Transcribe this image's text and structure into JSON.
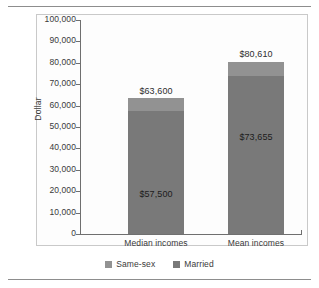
{
  "chart_data": {
    "type": "bar",
    "subtype": "stacked-bar",
    "title": "",
    "xlabel": "",
    "ylabel": "Dollar",
    "categories": [
      "Median incomes",
      "Mean incomes"
    ],
    "series": [
      {
        "name": "Married",
        "values": [
          57500,
          73655
        ],
        "color": "#797979"
      },
      {
        "name": "Same-sex",
        "values": [
          6100,
          6955
        ],
        "color": "#929292"
      }
    ],
    "totals": [
      63600,
      80610
    ],
    "bar_labels": {
      "totals": [
        "$63,600",
        "$80,610"
      ],
      "inner": [
        "$57,500",
        "$73,655"
      ]
    },
    "ylim": [
      0,
      100000
    ],
    "ytick_values": [
      0,
      10000,
      20000,
      30000,
      40000,
      50000,
      60000,
      70000,
      80000,
      90000,
      100000
    ],
    "ytick_labels": [
      "0",
      "10,000",
      "20,000",
      "30,000",
      "40,000",
      "50,000",
      "60,000",
      "70,000",
      "80,000",
      "90,000",
      "100,000"
    ],
    "grid": false,
    "legend_position": "bottom",
    "legend_order": [
      "Same-sex",
      "Married"
    ]
  },
  "legend": {
    "items": [
      {
        "label": "Same-sex",
        "color": "#929292"
      },
      {
        "label": "Married",
        "color": "#797979"
      }
    ]
  }
}
